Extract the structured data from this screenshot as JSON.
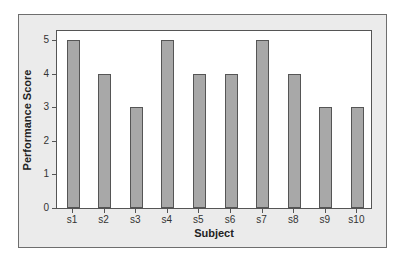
{
  "chart_data": {
    "type": "bar",
    "title": "",
    "xlabel": "Subject",
    "ylabel": "Performance Score",
    "categories": [
      "s1",
      "s2",
      "s3",
      "s4",
      "s5",
      "s6",
      "s7",
      "s8",
      "s9",
      "s10"
    ],
    "values": [
      5,
      4,
      3,
      5,
      4,
      4,
      5,
      4,
      3,
      3
    ],
    "ylim": [
      0,
      5
    ],
    "yticks": [
      "0",
      "1",
      "2",
      "3",
      "4",
      "5"
    ],
    "grid": false,
    "legend": null,
    "bar_color": "#a8a8a8",
    "background_color": "#ebebeb"
  }
}
